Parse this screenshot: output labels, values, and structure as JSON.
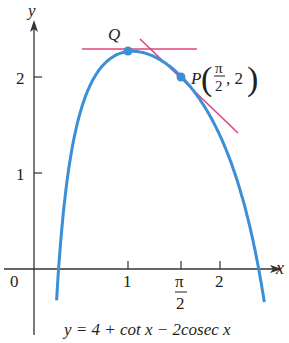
{
  "chart_data": {
    "type": "line",
    "title": "",
    "equation": "y = 4 + cot x − 2cosec x",
    "xlabel": "x",
    "ylabel": "y",
    "xlim": [
      -0.35,
      2.7
    ],
    "ylim": [
      -0.5,
      2.5
    ],
    "x_ticks": [
      {
        "value": 1,
        "label": "1"
      },
      {
        "value": 1.5708,
        "label": "π/2"
      },
      {
        "value": 2,
        "label": "2"
      }
    ],
    "y_ticks": [
      {
        "value": 1,
        "label": "1"
      },
      {
        "value": 2,
        "label": "2"
      }
    ],
    "origin_label": "0",
    "series": [
      {
        "name": "y = 4 + cot x − 2cosec x",
        "color": "#3a8fd6",
        "domain": [
          0.24,
          2.45
        ]
      }
    ],
    "points": [
      {
        "name": "Q",
        "x": 1.0472,
        "y": 2.2679,
        "label": "Q"
      },
      {
        "name": "P",
        "x": 1.5708,
        "y": 2,
        "label": "P(π/2, 2)"
      }
    ],
    "tangent_lines": [
      {
        "name": "horizontal tangent at Q",
        "slope": 0,
        "through": [
          1.0472,
          2.2679
        ],
        "x_range": [
          0.55,
          1.75
        ],
        "color": "#e0457b"
      },
      {
        "name": "tangent at P",
        "slope": -1,
        "through": [
          1.5708,
          2
        ],
        "x_range": [
          1.1,
          2.2
        ],
        "color": "#e0457b"
      }
    ]
  },
  "labels": {
    "y_axis": "y",
    "x_axis": "x",
    "origin": "0",
    "ytick_1": "1",
    "ytick_2": "2",
    "xtick_1": "1",
    "xtick_pi": "π",
    "xtick_pi_den": "2",
    "xtick_2": "2",
    "point_q": "Q",
    "point_p": "P",
    "p_num": "π",
    "p_den": "2",
    "p_y": ", 2",
    "equation": "y = 4 + cot x − 2cosec x"
  }
}
